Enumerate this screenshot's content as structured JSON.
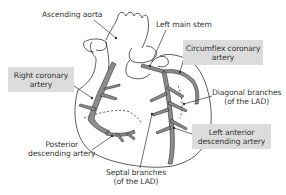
{
  "diagram": {
    "colors": {
      "artery_fill": "#8c8c8c",
      "outline": "#333333",
      "label_box": "#dcdcdc",
      "background": "#ffffff"
    },
    "labels": {
      "ascending_aorta": "Ascending aorta",
      "left_main_stem": "Left main stem",
      "circumflex": {
        "line1": "Circumflex coronary",
        "line2": "artery"
      },
      "right_coronary": {
        "line1": "Right coronary",
        "line2": "artery"
      },
      "diagonal": {
        "line1": "Diagonal branches",
        "line2": "(of the LAD)"
      },
      "lad": {
        "line1": "Left anterior",
        "line2": "descending artery"
      },
      "posterior_descending": {
        "line1": "Posterior",
        "line2": "descending artery"
      },
      "septal": {
        "line1": "Septal branches",
        "line2": "(of the LAD)"
      }
    }
  }
}
